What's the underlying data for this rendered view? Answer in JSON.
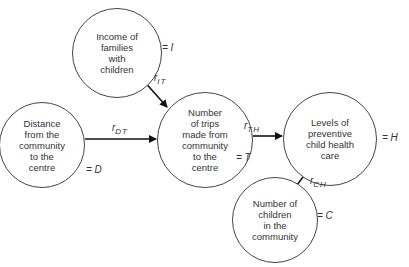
{
  "diagram": {
    "type": "path-diagram",
    "nodes": [
      {
        "id": "I",
        "label": "Income of\nfamilies\nwith\nchildren",
        "symbol": "= I"
      },
      {
        "id": "D",
        "label": "Distance\nfrom the\ncommunity\nto the\ncentre",
        "symbol": "= D"
      },
      {
        "id": "T",
        "label": "Number\nof trips\nmade from\ncommunity\nto the\ncentre",
        "symbol": "= T"
      },
      {
        "id": "H",
        "label": "Levels of\npreventive\nchild health\ncare",
        "symbol": "= H"
      },
      {
        "id": "C",
        "label": "Number of\nchildren\nin the\ncommunity",
        "symbol": "= C"
      }
    ],
    "edges": [
      {
        "from": "I",
        "to": "T",
        "label_main": "r",
        "label_sub": "IT"
      },
      {
        "from": "D",
        "to": "T",
        "label_main": "r",
        "label_sub": "DT"
      },
      {
        "from": "T",
        "to": "H",
        "label_main": "r",
        "label_sub": "TH"
      },
      {
        "from": "C",
        "to": "H",
        "label_main": "r",
        "label_sub": "CH"
      }
    ],
    "colors": {
      "line": "#111111",
      "circle": "#444444",
      "text": "#333333"
    }
  }
}
